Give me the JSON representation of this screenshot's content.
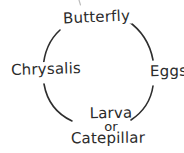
{
  "diagram": {
    "type": "cycle-diagram",
    "shape": "circle",
    "ink_color": "#2e2e2e",
    "background_color": "#ffffff",
    "style": "hand-drawn",
    "nodes": [
      {
        "id": "butterfly",
        "label": "Butterfly",
        "position": "top",
        "order": 1
      },
      {
        "id": "eggs",
        "label": "Eggs",
        "position": "right",
        "order": 2
      },
      {
        "id": "larva",
        "label": "Larva",
        "position": "bottom",
        "order": 3
      },
      {
        "id": "or",
        "label": "or",
        "position": "bottom",
        "order": 3
      },
      {
        "id": "catepillar",
        "label": "Catepillar",
        "position": "bottom",
        "order": 3
      },
      {
        "id": "chrysalis",
        "label": "Chrysalis",
        "position": "left",
        "order": 4
      }
    ],
    "arcs": [
      {
        "id": "arc-top-left",
        "from": "chrysalis",
        "to": "butterfly"
      },
      {
        "id": "arc-top-right",
        "from": "butterfly",
        "to": "eggs"
      },
      {
        "id": "arc-bottom-right",
        "from": "eggs",
        "to": "larva"
      },
      {
        "id": "arc-bottom-left",
        "from": "larva",
        "to": "chrysalis"
      }
    ]
  }
}
